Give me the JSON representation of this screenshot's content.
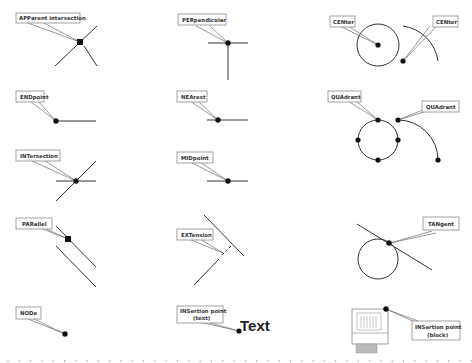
{
  "snaps": {
    "apparent_intersection": "APParent intersection",
    "perpendicular": "PERpendicular",
    "center_1": "CENter",
    "center_2": "CENter",
    "endpoint": "ENDpoint",
    "nearest": "NEArest",
    "quadrant_1": "QUAdrant",
    "quadrant_2": "QUAdrant",
    "intersection": "INTersection",
    "midpoint": "MIDpoint",
    "parallel": "PARallel",
    "extension": "EXTension",
    "tangent": "TANgent",
    "node": "NODe",
    "insertion_text_line1": "INSertion point",
    "insertion_text_line2": "(text)",
    "insertion_block_line1": "INSertion point",
    "insertion_block_line2": "(block)"
  },
  "sample_text": "Text",
  "colors": {
    "stroke": "#333333",
    "dot": "#111111",
    "label_border": "#8a8a8a"
  }
}
